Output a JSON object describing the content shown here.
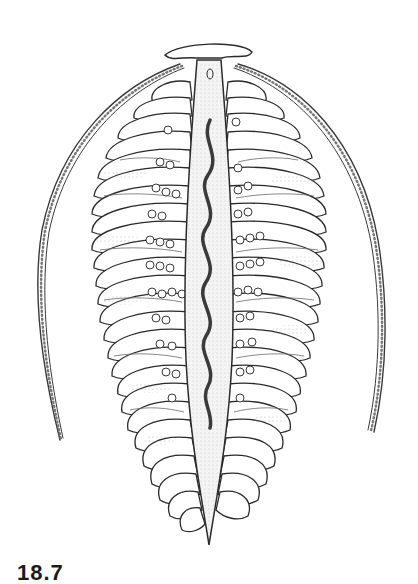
{
  "figure": {
    "label": "18.7",
    "colors": {
      "background": "#ffffff",
      "ink": "#2a2a2a",
      "shade": "#8a8a8a",
      "axis_fill": "#f2f2f2"
    }
  }
}
